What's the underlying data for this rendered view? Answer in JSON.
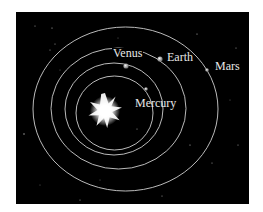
{
  "diagram": {
    "background": "#000000",
    "sun": {
      "cx": 105,
      "cy": 111,
      "r": 18,
      "rays": 10,
      "color": "#ffffff"
    },
    "orbit_color": "#cfcfcf",
    "planets": [
      {
        "name": "Mercury",
        "label": "Mercury",
        "orbit": {
          "cx": 114.5,
          "cy": 113,
          "rx": 38.5,
          "ry": 37
        },
        "pos": [
          146,
          89
        ],
        "label_pos": [
          135,
          107
        ]
      },
      {
        "name": "Venus",
        "label": "Venus",
        "orbit": {
          "cx": 114,
          "cy": 109,
          "rx": 49,
          "ry": 46
        },
        "pos": [
          126,
          66
        ],
        "label_pos": [
          112,
          57
        ]
      },
      {
        "name": "Earth",
        "label": "Earth",
        "orbit": {
          "cx": 118.5,
          "cy": 108.5,
          "rx": 67.5,
          "ry": 60.5
        },
        "pos": [
          160,
          59
        ],
        "label_pos": [
          167,
          60
        ]
      },
      {
        "name": "Mars",
        "label": "Mars",
        "orbit": {
          "cx": 125.5,
          "cy": 109,
          "rx": 92.5,
          "ry": 82
        },
        "pos": [
          207,
          70
        ],
        "label_pos": [
          216,
          70
        ]
      }
    ]
  }
}
